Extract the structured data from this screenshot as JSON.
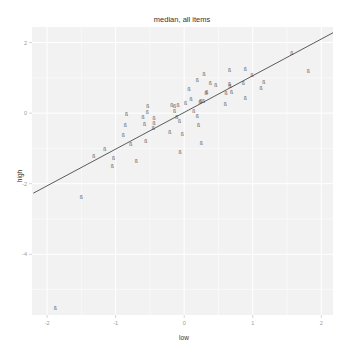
{
  "chart_data": {
    "type": "scatter",
    "title": "median, all items",
    "xlabel": "low",
    "ylabel": "high",
    "xlim": [
      -2.22,
      2.17
    ],
    "ylim": [
      -5.72,
      2.44
    ],
    "xticks": [
      -2,
      -1,
      0,
      1,
      2
    ],
    "yticks": [
      2,
      0,
      -2,
      -4
    ],
    "xtick_labels": [
      "-2",
      "-1",
      "0",
      "1",
      "2"
    ],
    "ytick_labels": [
      "2",
      "0",
      "-2",
      "-4"
    ],
    "grid": true,
    "legend": "none",
    "point_marker": "small text glyph",
    "points": [
      {
        "x": 1.57,
        "y": 1.71
      },
      {
        "x": 1.81,
        "y": 1.18
      },
      {
        "x": 0.66,
        "y": 1.22
      },
      {
        "x": 0.89,
        "y": 1.25
      },
      {
        "x": 0.99,
        "y": 1.07
      },
      {
        "x": 0.29,
        "y": 1.1
      },
      {
        "x": 0.19,
        "y": 0.95
      },
      {
        "x": 0.38,
        "y": 0.86
      },
      {
        "x": 0.46,
        "y": 0.81
      },
      {
        "x": 0.66,
        "y": 0.82
      },
      {
        "x": 0.67,
        "y": 0.76
      },
      {
        "x": 0.86,
        "y": 0.86
      },
      {
        "x": 1.16,
        "y": 0.87
      },
      {
        "x": 1.12,
        "y": 0.72
      },
      {
        "x": 0.07,
        "y": 0.69
      },
      {
        "x": 0.33,
        "y": 0.59
      },
      {
        "x": 0.61,
        "y": 0.58
      },
      {
        "x": 0.69,
        "y": 0.6
      },
      {
        "x": 0.1,
        "y": 0.4
      },
      {
        "x": 0.02,
        "y": 0.29
      },
      {
        "x": 0.24,
        "y": 0.35
      },
      {
        "x": 0.28,
        "y": 0.35
      },
      {
        "x": 0.89,
        "y": 0.42
      },
      {
        "x": 0.6,
        "y": 0.25
      },
      {
        "x": -0.84,
        "y": -0.03
      },
      {
        "x": -0.86,
        "y": -0.34
      },
      {
        "x": -0.89,
        "y": -0.62
      },
      {
        "x": -0.78,
        "y": -0.88
      },
      {
        "x": -0.56,
        "y": -0.79
      },
      {
        "x": -0.53,
        "y": 0.2
      },
      {
        "x": -0.54,
        "y": 0.03
      },
      {
        "x": -0.6,
        "y": -0.1
      },
      {
        "x": -0.58,
        "y": -0.3
      },
      {
        "x": -0.44,
        "y": -0.15
      },
      {
        "x": -0.44,
        "y": -0.27
      },
      {
        "x": -0.45,
        "y": -0.43
      },
      {
        "x": -0.21,
        "y": -0.54
      },
      {
        "x": -0.18,
        "y": 0.22
      },
      {
        "x": -0.14,
        "y": 0.2
      },
      {
        "x": -0.09,
        "y": 0.24
      },
      {
        "x": -0.14,
        "y": 0.05
      },
      {
        "x": -0.11,
        "y": -0.1
      },
      {
        "x": -0.07,
        "y": -0.23
      },
      {
        "x": -0.03,
        "y": -0.59
      },
      {
        "x": 0.14,
        "y": 0.07
      },
      {
        "x": 0.19,
        "y": -0.08
      },
      {
        "x": 0.21,
        "y": -0.34
      },
      {
        "x": 0.23,
        "y": 0.32
      },
      {
        "x": 0.32,
        "y": 0.58
      },
      {
        "x": 0.25,
        "y": -0.84
      },
      {
        "x": -0.06,
        "y": -1.1
      },
      {
        "x": -0.7,
        "y": -1.37
      },
      {
        "x": -1.16,
        "y": -1.03
      },
      {
        "x": -1.32,
        "y": -1.21
      },
      {
        "x": -1.03,
        "y": -1.28
      },
      {
        "x": -1.05,
        "y": -1.5
      },
      {
        "x": -1.5,
        "y": -2.37
      },
      {
        "x": -1.88,
        "y": -5.53
      }
    ],
    "fit_line": {
      "slope": 1.04,
      "intercept": 0.02,
      "x_from": -2.2,
      "x_to": 2.17
    },
    "colors": {
      "panel_bg": "#f2f2f2",
      "grid": "#ffffff",
      "line": "#333333",
      "point": "#555555"
    }
  },
  "point_glyph": "ß"
}
